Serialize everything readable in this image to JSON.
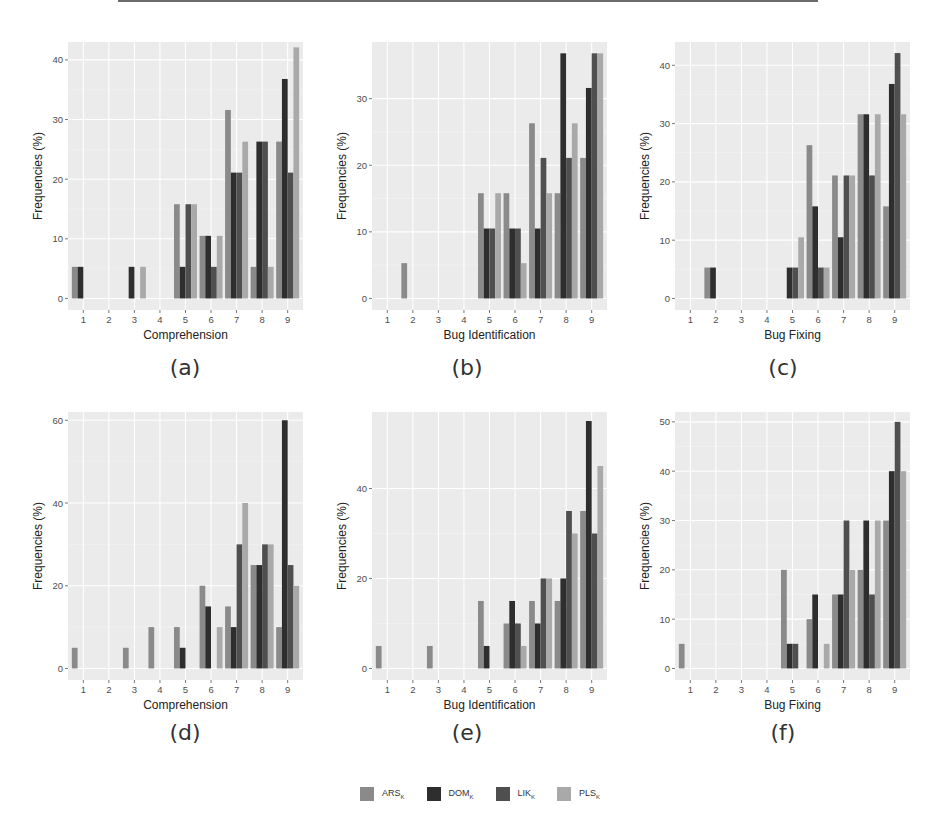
{
  "figure": {
    "captions": [
      "(a)",
      "(b)",
      "(c)",
      "(d)",
      "(e)",
      "(f)"
    ]
  },
  "legend": {
    "items": [
      {
        "key": "ARS",
        "label": "ARS",
        "subscript": "K",
        "color": "#8a8a8a"
      },
      {
        "key": "DOM",
        "label": "DOM",
        "subscript": "K",
        "color": "#2e2e2e"
      },
      {
        "key": "LIK",
        "label": "LIK",
        "subscript": "K",
        "color": "#4f4f4f"
      },
      {
        "key": "PLS",
        "label": "PLS",
        "subscript": "K",
        "color": "#a9a9a9"
      }
    ]
  },
  "chart_data": [
    {
      "id": "a",
      "type": "bar",
      "caption": "(a)",
      "title": "",
      "xlabel": "Comprehension",
      "ylabel": "Frequencies (%)",
      "categories": [
        "1",
        "2",
        "3",
        "4",
        "5",
        "6",
        "7",
        "8",
        "9"
      ],
      "ylim": [
        0,
        43
      ],
      "yticks": [
        0,
        10,
        20,
        30,
        40
      ],
      "grid": true,
      "series": [
        {
          "name": "ARS_K",
          "values": [
            5.3,
            0,
            0,
            0,
            15.8,
            10.5,
            31.6,
            5.3,
            26.3
          ]
        },
        {
          "name": "DOM_K",
          "values": [
            5.3,
            0,
            5.3,
            0,
            5.3,
            10.5,
            21.1,
            26.3,
            36.8
          ]
        },
        {
          "name": "LIK_K",
          "values": [
            0,
            0,
            0,
            0,
            15.8,
            5.3,
            21.1,
            26.3,
            21.1
          ]
        },
        {
          "name": "PLS_K",
          "values": [
            0,
            0,
            5.3,
            0,
            15.8,
            10.5,
            26.3,
            5.3,
            42.1
          ]
        }
      ]
    },
    {
      "id": "b",
      "type": "bar",
      "caption": "(b)",
      "title": "",
      "xlabel": "Bug Identification",
      "ylabel": "Frequencies (%)",
      "categories": [
        "1",
        "2",
        "3",
        "4",
        "5",
        "6",
        "7",
        "8",
        "9"
      ],
      "ylim": [
        0,
        38.5
      ],
      "yticks": [
        0,
        10,
        20,
        30
      ],
      "grid": true,
      "series": [
        {
          "name": "ARS_K",
          "values": [
            0,
            5.3,
            0,
            0,
            15.8,
            15.8,
            26.3,
            15.8,
            21.1
          ]
        },
        {
          "name": "DOM_K",
          "values": [
            0,
            0,
            0,
            0,
            10.5,
            10.5,
            10.5,
            36.8,
            31.6
          ]
        },
        {
          "name": "LIK_K",
          "values": [
            0,
            0,
            0,
            0,
            10.5,
            10.5,
            21.1,
            21.1,
            36.8
          ]
        },
        {
          "name": "PLS_K",
          "values": [
            0,
            0,
            0,
            0,
            15.8,
            5.3,
            15.8,
            26.3,
            36.8
          ]
        }
      ]
    },
    {
      "id": "c",
      "type": "bar",
      "caption": "(c)",
      "title": "",
      "xlabel": "Bug Fixing",
      "ylabel": "Frequencies (%)",
      "categories": [
        "1",
        "2",
        "3",
        "4",
        "5",
        "6",
        "7",
        "8",
        "9"
      ],
      "ylim": [
        0,
        44
      ],
      "yticks": [
        0,
        10,
        20,
        30,
        40
      ],
      "grid": true,
      "series": [
        {
          "name": "ARS_K",
          "values": [
            0,
            5.3,
            0,
            0,
            0,
            26.3,
            21.1,
            31.6,
            15.8
          ]
        },
        {
          "name": "DOM_K",
          "values": [
            0,
            5.3,
            0,
            0,
            5.3,
            15.8,
            10.5,
            31.6,
            36.8
          ]
        },
        {
          "name": "LIK_K",
          "values": [
            0,
            0,
            0,
            0,
            5.3,
            5.3,
            21.1,
            21.1,
            42.1
          ]
        },
        {
          "name": "PLS_K",
          "values": [
            0,
            0,
            0,
            0,
            10.5,
            5.3,
            21.1,
            31.6,
            31.6
          ]
        }
      ]
    },
    {
      "id": "d",
      "type": "bar",
      "caption": "(d)",
      "title": "",
      "xlabel": "Comprehension",
      "ylabel": "Frequencies (%)",
      "categories": [
        "1",
        "2",
        "3",
        "4",
        "5",
        "6",
        "7",
        "8",
        "9"
      ],
      "ylim": [
        0,
        62
      ],
      "yticks": [
        0,
        20,
        40,
        60
      ],
      "grid": true,
      "series": [
        {
          "name": "ARS_K",
          "values": [
            5,
            0,
            5,
            10,
            10,
            20,
            15,
            25,
            10
          ]
        },
        {
          "name": "DOM_K",
          "values": [
            0,
            0,
            0,
            0,
            5,
            15,
            10,
            25,
            60
          ]
        },
        {
          "name": "LIK_K",
          "values": [
            0,
            0,
            0,
            0,
            0,
            0,
            30,
            30,
            25
          ]
        },
        {
          "name": "PLS_K",
          "values": [
            0,
            0,
            0,
            0,
            0,
            10,
            40,
            30,
            20
          ]
        }
      ]
    },
    {
      "id": "e",
      "type": "bar",
      "caption": "(e)",
      "title": "",
      "xlabel": "Bug Identification",
      "ylabel": "Frequencies (%)",
      "categories": [
        "1",
        "2",
        "3",
        "4",
        "5",
        "6",
        "7",
        "8",
        "9"
      ],
      "ylim": [
        0,
        57
      ],
      "yticks": [
        0,
        20,
        40
      ],
      "grid": true,
      "series": [
        {
          "name": "ARS_K",
          "values": [
            5,
            0,
            5,
            0,
            15,
            10,
            15,
            15,
            35
          ]
        },
        {
          "name": "DOM_K",
          "values": [
            0,
            0,
            0,
            0,
            5,
            15,
            10,
            20,
            55
          ]
        },
        {
          "name": "LIK_K",
          "values": [
            0,
            0,
            0,
            0,
            0,
            10,
            20,
            35,
            30
          ]
        },
        {
          "name": "PLS_K",
          "values": [
            0,
            0,
            0,
            0,
            0,
            5,
            20,
            30,
            45
          ]
        }
      ]
    },
    {
      "id": "f",
      "type": "bar",
      "caption": "(f)",
      "title": "",
      "xlabel": "Bug Fixing",
      "ylabel": "Frequencies (%)",
      "categories": [
        "1",
        "2",
        "3",
        "4",
        "5",
        "6",
        "7",
        "8",
        "9"
      ],
      "ylim": [
        0,
        52
      ],
      "yticks": [
        0,
        10,
        20,
        30,
        40,
        50
      ],
      "grid": true,
      "series": [
        {
          "name": "ARS_K",
          "values": [
            5,
            0,
            0,
            0,
            20,
            10,
            15,
            20,
            30
          ]
        },
        {
          "name": "DOM_K",
          "values": [
            0,
            0,
            0,
            0,
            5,
            15,
            15,
            30,
            40
          ]
        },
        {
          "name": "LIK_K",
          "values": [
            0,
            0,
            0,
            0,
            5,
            0,
            30,
            15,
            50
          ]
        },
        {
          "name": "PLS_K",
          "values": [
            0,
            0,
            0,
            0,
            0,
            5,
            20,
            30,
            40
          ]
        }
      ]
    }
  ]
}
